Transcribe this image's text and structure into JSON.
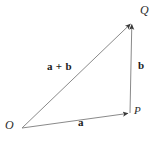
{
  "figure": {
    "background_color": "#ffffff",
    "line_color": "#8a8a8a",
    "label_color": "#1c1c1c",
    "width": 159,
    "height": 145
  },
  "points": [
    {
      "name": "O",
      "label": "O",
      "x": 22,
      "y": 128
    },
    {
      "name": "P",
      "label": "P",
      "x": 130,
      "y": 113
    },
    {
      "name": "Q",
      "label": "Q",
      "x": 132,
      "y": 22
    }
  ],
  "vectors": [
    {
      "name": "a",
      "label": "a",
      "from": "O",
      "to": "P",
      "arrowhead": "P"
    },
    {
      "name": "b",
      "label": "b",
      "from": "P",
      "to": "Q",
      "arrowhead": "Q"
    },
    {
      "name": "a-plus-b",
      "label": "a + b",
      "from": "O",
      "to": "Q",
      "arrowhead": "Q"
    }
  ],
  "labels": {
    "point_O": "O",
    "point_P": "P",
    "point_Q": "Q",
    "vector_a": "a",
    "vector_b": "b",
    "vector_sum": "a + b"
  }
}
